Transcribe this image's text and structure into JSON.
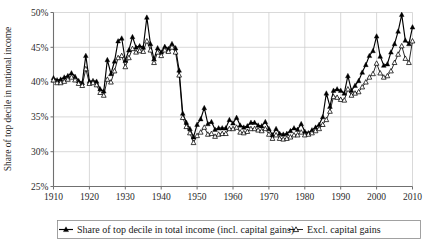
{
  "chart_data": {
    "type": "line",
    "title": "",
    "xlabel": "",
    "ylabel": "Share of top decile in national income",
    "xlim": [
      1910,
      2010
    ],
    "ylim": [
      25,
      50
    ],
    "grid": true,
    "legend_position": "bottom",
    "x_ticks": [
      "1910",
      "1920",
      "1930",
      "1940",
      "1950",
      "1960",
      "1970",
      "1980",
      "1990",
      "2000",
      "2010"
    ],
    "y_ticks": [
      "25%",
      "30%",
      "35%",
      "40%",
      "45%",
      "50%"
    ],
    "x": [
      1910,
      1911,
      1912,
      1913,
      1914,
      1915,
      1916,
      1917,
      1918,
      1919,
      1920,
      1921,
      1922,
      1923,
      1924,
      1925,
      1926,
      1927,
      1928,
      1929,
      1930,
      1931,
      1932,
      1933,
      1934,
      1935,
      1936,
      1937,
      1938,
      1939,
      1940,
      1941,
      1942,
      1943,
      1944,
      1945,
      1946,
      1947,
      1948,
      1949,
      1950,
      1951,
      1952,
      1953,
      1954,
      1955,
      1956,
      1957,
      1958,
      1959,
      1960,
      1961,
      1962,
      1963,
      1964,
      1965,
      1966,
      1967,
      1968,
      1969,
      1970,
      1971,
      1972,
      1973,
      1974,
      1975,
      1976,
      1977,
      1978,
      1979,
      1980,
      1981,
      1982,
      1983,
      1984,
      1985,
      1986,
      1987,
      1988,
      1989,
      1990,
      1991,
      1992,
      1993,
      1994,
      1995,
      1996,
      1997,
      1998,
      1999,
      2000,
      2001,
      2002,
      2003,
      2004,
      2005,
      2006,
      2007,
      2008,
      2009,
      2010
    ],
    "series": [
      {
        "name": "Share of top decile in total income (incl. capital gains)",
        "marker": "filled-triangle",
        "color": "#000000",
        "values": [
          40.6,
          40.3,
          40.4,
          40.7,
          40.9,
          41.3,
          40.8,
          40.2,
          39.9,
          43.8,
          40.1,
          40.2,
          40.1,
          39.0,
          38.7,
          43.2,
          41.2,
          43.0,
          45.9,
          46.3,
          43.1,
          44.6,
          46.5,
          45.0,
          45.2,
          45.0,
          49.3,
          45.5,
          43.3,
          44.9,
          44.3,
          45.1,
          44.8,
          45.5,
          44.9,
          41.7,
          35.5,
          34.2,
          33.3,
          32.1,
          33.9,
          34.7,
          36.3,
          34.0,
          34.3,
          33.2,
          33.4,
          33.4,
          33.4,
          34.6,
          34.1,
          34.9,
          33.8,
          33.5,
          33.7,
          34.2,
          34.2,
          33.8,
          33.7,
          34.3,
          33.3,
          32.4,
          33.3,
          32.6,
          32.5,
          32.6,
          33.0,
          33.4,
          33.2,
          34.0,
          32.9,
          32.7,
          33.1,
          33.5,
          33.9,
          35.0,
          38.4,
          36.5,
          38.8,
          39.0,
          38.8,
          38.4,
          40.9,
          38.8,
          39.5,
          40.2,
          41.4,
          42.5,
          43.8,
          44.5,
          46.6,
          43.7,
          42.4,
          42.6,
          44.3,
          45.5,
          47.3,
          49.7,
          46.0,
          45.5,
          47.9
        ]
      },
      {
        "name": "Excl. capital gains",
        "marker": "open-triangle",
        "color": "#000000",
        "values": [
          40.3,
          39.9,
          39.9,
          40.1,
          40.4,
          40.7,
          40.3,
          39.8,
          39.5,
          41.9,
          39.8,
          39.9,
          39.6,
          38.5,
          38.1,
          40.4,
          40.0,
          41.6,
          43.5,
          43.8,
          42.2,
          43.5,
          44.8,
          44.3,
          44.5,
          44.4,
          45.9,
          44.6,
          42.8,
          44.3,
          43.8,
          44.6,
          44.4,
          45.0,
          44.3,
          41.0,
          34.9,
          33.6,
          32.7,
          31.3,
          32.3,
          32.8,
          33.5,
          32.5,
          32.6,
          32.2,
          32.5,
          32.6,
          32.6,
          33.3,
          33.3,
          33.5,
          32.8,
          32.7,
          32.9,
          33.3,
          33.3,
          33.1,
          33.0,
          33.3,
          32.5,
          31.9,
          32.4,
          31.9,
          31.8,
          31.9,
          32.1,
          32.4,
          32.4,
          32.8,
          32.4,
          32.5,
          32.7,
          33.0,
          33.3,
          33.9,
          34.6,
          35.8,
          37.9,
          37.8,
          37.5,
          37.4,
          39.0,
          38.1,
          38.4,
          38.6,
          39.3,
          40.0,
          40.7,
          41.2,
          42.7,
          41.3,
          40.7,
          40.9,
          41.6,
          42.8,
          44.0,
          45.2,
          43.4,
          42.8,
          45.9
        ]
      }
    ],
    "legend": [
      {
        "label": "Share of top decile in total income (incl. capital gains)",
        "marker": "filled-triangle"
      },
      {
        "label": "Excl. capital gains",
        "marker": "open-triangle"
      }
    ]
  },
  "axis": {
    "y_label": "Share of top decile in national income"
  },
  "colors": {
    "grid": "#c8c8c8",
    "axis": "#707070",
    "series": "#000000",
    "legend_border": "#8a8a8a",
    "text": "#1a1a1a"
  }
}
